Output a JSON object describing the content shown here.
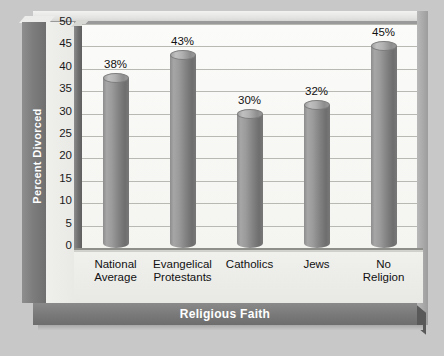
{
  "chart_data": {
    "type": "bar",
    "title": "",
    "xlabel": "Religious Faith",
    "ylabel": "Percent Divorced",
    "categories": [
      "National Average",
      "Evangelical Protestants",
      "Catholics",
      "Jews",
      "No Religion"
    ],
    "category_lines": [
      [
        "National",
        "Average"
      ],
      [
        "Evangelical",
        "Protestants"
      ],
      [
        "Catholics",
        ""
      ],
      [
        "Jews",
        ""
      ],
      [
        "No",
        "Religion"
      ]
    ],
    "values": [
      38,
      43,
      30,
      32,
      45
    ],
    "value_labels": [
      "38%",
      "43%",
      "30%",
      "32%",
      "45%"
    ],
    "ylim": [
      0,
      50
    ],
    "ytick_values": [
      50,
      45,
      40,
      35,
      30,
      25,
      20,
      15,
      10,
      5,
      0
    ],
    "ytick_labels": [
      "50",
      "45",
      "40",
      "35",
      "30",
      "25",
      "20",
      "15",
      "10",
      "5",
      "0"
    ],
    "grid": true,
    "legend": false,
    "style": "3d-cylinder",
    "colors": {
      "bar": "#8b8b8b",
      "plot_background": "#f7f7f4",
      "gridline": "#b9b9b4",
      "axis_band": "#7a7a7a",
      "axis_band_text": "#ffffff",
      "page_background": "#c8c8c8",
      "label_text": "#111111"
    }
  }
}
